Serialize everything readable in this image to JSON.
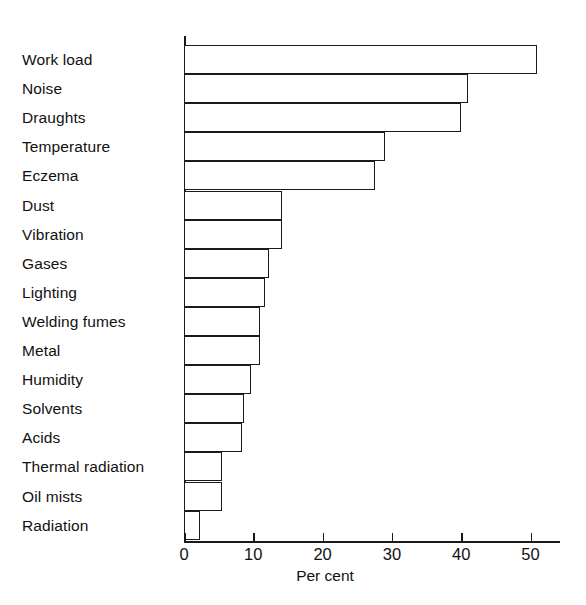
{
  "chart_data": {
    "type": "bar",
    "orientation": "horizontal",
    "title": "",
    "xlabel": "Per cent",
    "ylabel": "",
    "xlim": [
      0,
      54.5
    ],
    "ylim": null,
    "grid": false,
    "legend": null,
    "bar_style": "outlined-white-fill",
    "xticks": [
      0,
      10,
      20,
      30,
      40,
      50
    ],
    "xticklabels": [
      "0",
      "10",
      "20",
      "30",
      "40",
      "50"
    ],
    "categories": [
      "Work load",
      "Noise",
      "Draughts",
      "Temperature",
      "Eczema",
      "Dust",
      "Vibration",
      "Gases",
      "Lighting",
      "Welding fumes",
      "Metal",
      "Humidity",
      "Solvents",
      "Acids",
      "Thermal radiation",
      "Oil mists",
      "Radiation"
    ],
    "values": [
      51,
      41,
      40,
      29,
      27.5,
      14.2,
      14.2,
      12.3,
      11.7,
      10.9,
      10.9,
      9.6,
      8.6,
      8.3,
      5.5,
      5.5,
      2.3
    ]
  },
  "axis": {
    "x_title": "Per cent",
    "tick_labels": [
      "0",
      "10",
      "20",
      "30",
      "40",
      "50"
    ]
  },
  "caption": {
    "text": ""
  }
}
